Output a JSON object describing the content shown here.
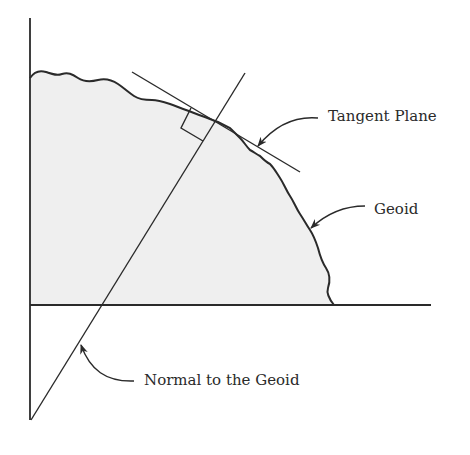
{
  "diagram": {
    "labels": {
      "tangent_plane": "Tangent Plane",
      "geoid": "Geoid",
      "normal": "Normal to the Geoid"
    },
    "colors": {
      "stroke": "#2a2a2a",
      "fill": "#efefef",
      "background": "#ffffff"
    },
    "elements": [
      {
        "id": "vertical-axis",
        "type": "line",
        "from": [
          30,
          18
        ],
        "to": [
          30,
          420
        ]
      },
      {
        "id": "horizontal-axis",
        "type": "line",
        "from": [
          30,
          305
        ],
        "to": [
          431,
          305
        ]
      },
      {
        "id": "geoid-surface",
        "type": "irregular-curve",
        "from": [
          30,
          78
        ],
        "to": [
          334,
          305
        ]
      },
      {
        "id": "tangent-plane-line",
        "type": "line",
        "from": [
          132,
          72
        ],
        "to": [
          300,
          172
        ]
      },
      {
        "id": "normal-line",
        "type": "line",
        "from": [
          31,
          420
        ],
        "to": [
          245,
          73
        ]
      },
      {
        "id": "right-angle-marker",
        "type": "square"
      }
    ]
  }
}
